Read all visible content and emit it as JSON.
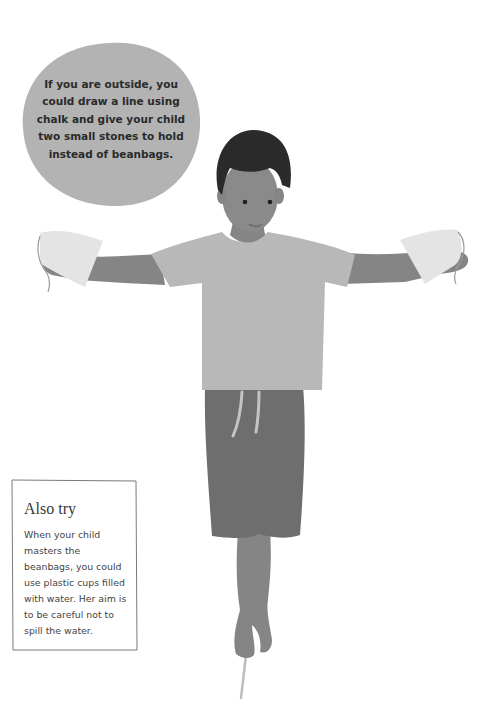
{
  "tip_bubble": {
    "text": "If you are outside, you\ncould draw a line using\nchalk and give your child\ntwo small stones to hold\ninstead of beanbags."
  },
  "also_try": {
    "title": "Also try",
    "body": "When your child\nmasters the\nbeanbags, you could\nuse plastic cups filled\nwith water. Her aim is\nto be careful not to\nspill the water."
  },
  "colors": {
    "bubble": "#b3b3b3",
    "shirt": "#b8b8b8",
    "skin": "#8a8a8a",
    "hair": "#2b2b2b",
    "shorts": "#6e6e6e",
    "beanbag": "#e4e4e4",
    "line": "#bdbdbd"
  }
}
